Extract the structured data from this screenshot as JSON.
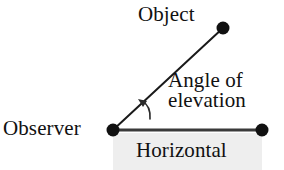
{
  "diagram": {
    "background_color": "#ffffff",
    "stroke_color": "#1a1a1a",
    "shade_color": "#eeeeee",
    "labels": {
      "object": "Object",
      "observer": "Observer",
      "horizontal": "Horizontal",
      "angle_line1": "Angle of",
      "angle_line2": "elevation"
    },
    "points": {
      "observer": {
        "x": 113,
        "y": 130,
        "radius": 6
      },
      "object": {
        "x": 223,
        "y": 28,
        "radius": 6
      },
      "horizontal_end": {
        "x": 262,
        "y": 130,
        "radius": 6
      }
    },
    "lines": {
      "line_of_sight": {
        "x1": 113,
        "y1": 130,
        "x2": 223,
        "y2": 28,
        "width": 2
      },
      "horizontal": {
        "x1": 113,
        "y1": 130,
        "x2": 262,
        "y2": 130,
        "width": 3
      }
    },
    "angle_arc": {
      "path": "M 150 118 Q 150 106 141 101",
      "arrow_tip": {
        "x": 139,
        "y": 100
      },
      "width": 1.6
    },
    "shade_rect": {
      "x": 113,
      "y": 133,
      "width": 149,
      "height": 37
    }
  }
}
